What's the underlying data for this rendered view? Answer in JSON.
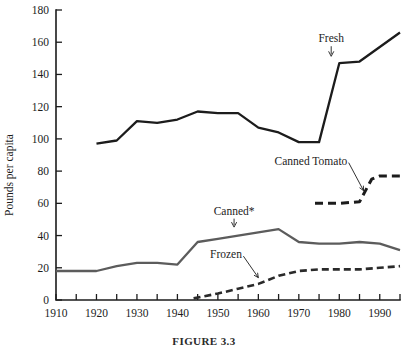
{
  "figure": {
    "caption": "FIGURE 3.3"
  },
  "chart_data": {
    "type": "line",
    "title": "",
    "xlabel": "",
    "ylabel": "Pounds per capita",
    "xlim": [
      1910,
      1995
    ],
    "ylim": [
      0,
      180
    ],
    "yticks": [
      0,
      20,
      40,
      60,
      80,
      100,
      120,
      140,
      160,
      180
    ],
    "ytick_labels": [
      "0",
      "20",
      "40",
      "60",
      "80",
      "100",
      "120",
      "140",
      "160",
      "180"
    ],
    "xticks": [
      1910,
      1915,
      1920,
      1925,
      1930,
      1935,
      1940,
      1945,
      1950,
      1955,
      1960,
      1965,
      1970,
      1975,
      1980,
      1985,
      1990,
      1995
    ],
    "xtick_labels_major": [
      "1910",
      "1920",
      "1930",
      "1940",
      "1950",
      "1960",
      "1970",
      "1980",
      "1990"
    ],
    "xticks_major": [
      1910,
      1920,
      1930,
      1940,
      1950,
      1960,
      1970,
      1980,
      1990
    ],
    "grid": false,
    "legend_position": "inline-annotations",
    "series": [
      {
        "name": "Fresh",
        "label": "Fresh",
        "style": "solid",
        "color": "#1c1c1c",
        "width": 2.3,
        "x": [
          1920,
          1925,
          1930,
          1935,
          1940,
          1945,
          1950,
          1955,
          1960,
          1965,
          1970,
          1975,
          1980,
          1985,
          1990,
          1995
        ],
        "y": [
          97,
          99,
          111,
          110,
          112,
          117,
          116,
          116,
          107,
          104,
          98,
          98,
          147,
          148,
          157,
          166
        ]
      },
      {
        "name": "Canned",
        "label": "Canned*",
        "style": "solid",
        "color": "#5c5c5c",
        "width": 2.3,
        "x": [
          1910,
          1915,
          1920,
          1925,
          1930,
          1935,
          1940,
          1945,
          1950,
          1955,
          1960,
          1965,
          1970,
          1975,
          1980,
          1985,
          1990,
          1995
        ],
        "y": [
          18,
          18,
          18,
          21,
          23,
          23,
          22,
          36,
          38,
          40,
          42,
          44,
          36,
          35,
          35,
          36,
          35,
          31
        ]
      },
      {
        "name": "Frozen",
        "label": "Frozen",
        "style": "dashed",
        "color": "#2a2a2a",
        "width": 2.6,
        "x": [
          1944,
          1946,
          1950,
          1955,
          1960,
          1965,
          1970,
          1975,
          1980,
          1985,
          1990,
          1995
        ],
        "y": [
          1,
          2,
          4,
          7,
          10,
          15,
          18,
          19,
          19,
          19,
          20,
          21
        ]
      },
      {
        "name": "Canned Tomato",
        "label": "Canned Tomato",
        "style": "dashed",
        "color": "#1c1c1c",
        "width": 3.0,
        "x": [
          1974,
          1980,
          1985,
          1988,
          1990,
          1995
        ],
        "y": [
          60,
          60,
          61,
          75,
          77,
          77
        ]
      }
    ],
    "annotations": [
      {
        "text": "Fresh",
        "x": 1978,
        "y": 160,
        "target_x": 1978,
        "target_y": 150
      },
      {
        "text": "Canned*",
        "x": 1954,
        "y": 53,
        "target_x": 1954,
        "target_y": 44
      },
      {
        "text": "Frozen",
        "x": 1952,
        "y": 26,
        "target_x": 1960,
        "target_y": 12
      },
      {
        "text": "Canned Tomato",
        "x": 1973,
        "y": 84,
        "target_x": 1986,
        "target_y": 66
      }
    ]
  }
}
